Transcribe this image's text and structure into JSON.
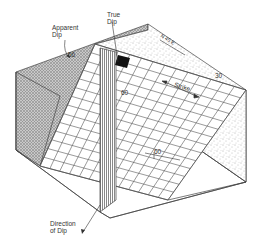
{
  "diagram": {
    "labels": {
      "true_dip": [
        "True",
        "Dip"
      ],
      "apparent_dip": [
        "Apparent",
        "Dip"
      ],
      "direction_of_dip": [
        "Direction",
        "of Dip"
      ],
      "strike": "Strike",
      "angle_apparent": "56",
      "angle_true": "60",
      "angle_right": "30",
      "plane_dip": "60",
      "bearing": "N 45 E"
    },
    "colors": {
      "line": "#444444",
      "grid": "#555555",
      "stipple": "#777777",
      "crosshatch": "#9a9a9a",
      "black_square": "#111111"
    }
  }
}
